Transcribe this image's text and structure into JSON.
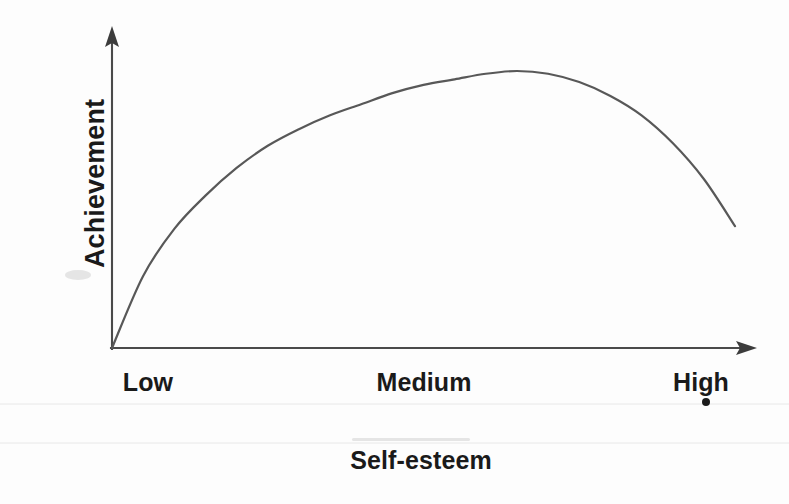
{
  "figure": {
    "background_color": "#fdfdfd",
    "line_color": "#585858",
    "axis_color": "#4a4a4a",
    "text_color": "#1a1a1a"
  },
  "axes": {
    "y_title": "Achievement",
    "x_title": "Self-esteem",
    "x_tick_labels": [
      "Low",
      "Medium",
      "High"
    ],
    "y_tick_labels": []
  },
  "chart_data": {
    "type": "line",
    "title": "",
    "subtitle": "",
    "xlabel": "Self-esteem",
    "ylabel": "Achievement",
    "xlim": [
      0,
      1
    ],
    "ylim": [
      0,
      1
    ],
    "grid": false,
    "legend": null,
    "x_tick_labels": [
      "Low",
      "Medium",
      "High"
    ],
    "x_tick_positions": [
      0.13,
      0.59,
      1.0
    ],
    "y_tick_labels": [],
    "annotations": [],
    "series": [
      {
        "name": "Achievement",
        "x": [
          0.0,
          0.05,
          0.1,
          0.15,
          0.2,
          0.25,
          0.3,
          0.35,
          0.4,
          0.45,
          0.5,
          0.55,
          0.6,
          0.65,
          0.7,
          0.75,
          0.8,
          0.85,
          0.9,
          0.95,
          1.0
        ],
        "values": [
          0.0,
          0.26,
          0.43,
          0.55,
          0.65,
          0.73,
          0.79,
          0.84,
          0.88,
          0.92,
          0.95,
          0.97,
          0.99,
          1.0,
          0.99,
          0.96,
          0.91,
          0.84,
          0.74,
          0.61,
          0.44
        ]
      }
    ]
  },
  "artifacts": {
    "scan_line_label": "scan-line-artifact",
    "smudge_label": "scan-smudge-artifact",
    "ink-dot_label": "ink-dot-artifact"
  }
}
